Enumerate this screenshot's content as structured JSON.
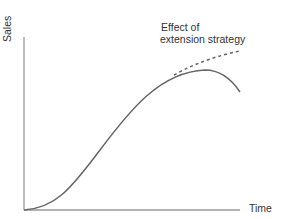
{
  "diagram": {
    "type": "product-life-cycle",
    "y_axis_label": "Sales",
    "x_axis_label": "Time",
    "annotation": {
      "line1": "Effect of",
      "line2": "extension strategy"
    },
    "curves": [
      {
        "name": "product life cycle",
        "style": "solid"
      },
      {
        "name": "extension strategy",
        "style": "dashed"
      }
    ],
    "colors": {
      "axis": "#999999",
      "curve": "#666666",
      "text": "#333333"
    }
  }
}
